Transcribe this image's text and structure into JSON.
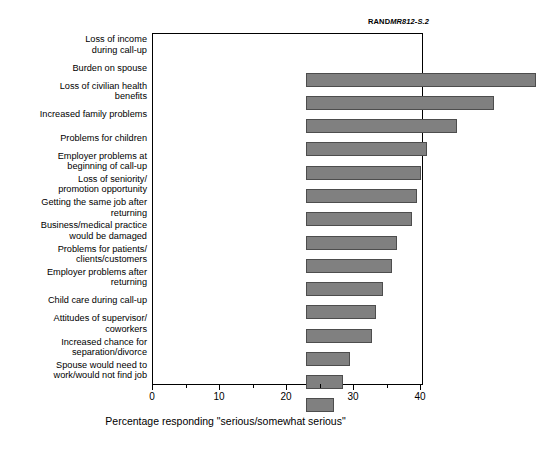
{
  "figure": {
    "source_mark": "RAND",
    "source_number": "MR812-S.2"
  },
  "chart_data": {
    "type": "bar",
    "orientation": "horizontal",
    "title": "",
    "xlabel": "Percentage responding \"serious/somewhat serious\"",
    "ylabel": "",
    "xlim": [
      0,
      40
    ],
    "ylim": null,
    "grid": false,
    "legend": null,
    "xticks": [
      "0",
      "10",
      "20",
      "30",
      "40"
    ],
    "xtick_values": [
      0,
      10,
      20,
      30,
      40
    ],
    "xminor_values": [
      5,
      15,
      25,
      35
    ],
    "bar_color": "#808080",
    "bar_edge_color": "#4d4d4d",
    "categories": [
      "Loss of income\nduring call-up",
      "Burden on spouse",
      "Loss of civilian health\nbenefits",
      "Increased family problems",
      "Problems for children",
      "Employer problems at\nbeginning of call-up",
      "Loss of seniority/\npromotion opportunity",
      "Getting the same job after\nreturning",
      "Business/medical practice\nwould be damaged",
      "Problems for patients/\nclients/customers",
      "Employer problems after\nreturning",
      "Child care during call-up",
      "Attitudes of supervisor/\ncoworkers",
      "Increased chance for\nseparation/divorce",
      "Spouse would need to\nwork/would not find job"
    ],
    "values": [
      34.3,
      28.0,
      22.5,
      18.0,
      17.1,
      16.5,
      15.8,
      13.6,
      12.8,
      11.5,
      10.5,
      9.8,
      6.5,
      5.5,
      4.2
    ]
  }
}
